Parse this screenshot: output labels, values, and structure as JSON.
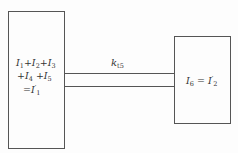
{
  "diagram": {
    "type": "two-block connection",
    "left_block": {
      "lines": [
        {
          "parts": [
            {
              "t": "I"
            },
            {
              "s": "1"
            },
            {
              "t": "+I"
            },
            {
              "s": "2"
            },
            {
              "t": "+I"
            },
            {
              "s": "3"
            }
          ]
        },
        {
          "parts": [
            {
              "t": "+I"
            },
            {
              "s": "4"
            },
            {
              "t": " +I"
            },
            {
              "s": "5"
            }
          ]
        },
        {
          "parts": [
            {
              "t": "=I"
            },
            {
              "p": "′"
            },
            {
              "s": "1"
            }
          ]
        }
      ],
      "text": "I1+I2+I3 +I4 +I5 =I'1"
    },
    "right_block": {
      "text": "I6 = I'2",
      "parts": [
        {
          "t": "I"
        },
        {
          "s": "6"
        },
        {
          "t": " = I"
        },
        {
          "p": "′"
        },
        {
          "s": "2"
        }
      ]
    },
    "connector": {
      "label_main": "k",
      "label_sub": "t5",
      "text": "k_t5"
    }
  },
  "colors": {
    "stroke": "#555555",
    "background": "#fdfdfd",
    "text": "#333333"
  }
}
